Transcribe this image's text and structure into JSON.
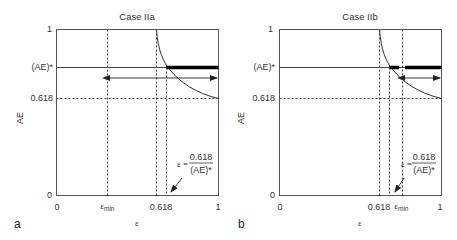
{
  "figure": {
    "panels": [
      {
        "letter": "a",
        "title": "Case IIa",
        "ylabel": "AE",
        "xlabel": "ε",
        "y_ticks": {
          "top": "1",
          "ae_star": "(AE)*",
          "mid": "0.618",
          "bottom": "0"
        },
        "x_ticks": {
          "left": "0",
          "eps_min": "ε",
          "eps_min_sub": "min",
          "golden": "0.618",
          "right": "1"
        },
        "annotation": {
          "lhs": "ε =",
          "num": "0.618",
          "den": "(AE)*"
        }
      },
      {
        "letter": "b",
        "title": "Case IIb",
        "ylabel": "AE",
        "xlabel": "ε",
        "y_ticks": {
          "top": "1",
          "ae_star": "(AE)*",
          "mid": "0.618",
          "bottom": "0"
        },
        "x_ticks": {
          "left": "0",
          "golden": "0.618",
          "eps_min": "ε",
          "eps_min_sub": "min",
          "right": "1"
        },
        "annotation": {
          "lhs": "ε =",
          "num": "0.618",
          "den": "(AE)*"
        }
      }
    ]
  }
}
